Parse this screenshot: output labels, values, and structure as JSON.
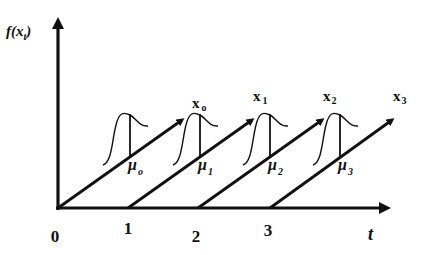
{
  "diagram": {
    "y_axis_label": "f(x",
    "y_axis_label_sub": "t",
    "y_axis_label_close": ")",
    "x_axis_label": "t",
    "ticks": [
      {
        "label": "0",
        "x": 58
      },
      {
        "label": "1",
        "x": 130
      },
      {
        "label": "2",
        "x": 198
      },
      {
        "label": "3",
        "x": 270
      }
    ],
    "series": [
      {
        "name": "x",
        "sub": "o",
        "mean": "μ",
        "mean_sub": "o"
      },
      {
        "name": "x",
        "sub": "1",
        "mean": "μ",
        "mean_sub": "1"
      },
      {
        "name": "x",
        "sub": "2",
        "mean": "μ",
        "mean_sub": "2"
      },
      {
        "name": "x",
        "sub": "3",
        "mean": "μ",
        "mean_sub": "3"
      }
    ],
    "colors": {
      "ink": "#111111",
      "background": "#ffffff"
    }
  }
}
